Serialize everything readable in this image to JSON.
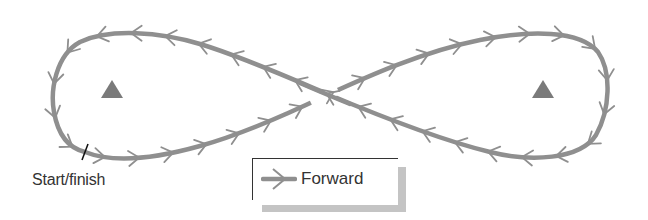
{
  "diagram": {
    "start_label": "Start/finish",
    "legend": {
      "items": [
        {
          "symbol": "arrow-icon",
          "label": "Forward"
        }
      ]
    },
    "landmarks": [
      {
        "name": "left-triangle",
        "cx": 112,
        "cy": 90
      },
      {
        "name": "right-triangle",
        "cx": 543,
        "cy": 90
      }
    ],
    "colors": {
      "track": "#8f8f8f",
      "landmark": "#7a7a7a",
      "tick": "#111111",
      "text": "#333333",
      "legend_shadow": "#c4c4c4"
    },
    "arrow_count": 38
  }
}
